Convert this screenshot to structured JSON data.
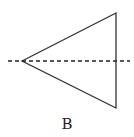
{
  "figure": {
    "label": "B",
    "shape": "triangle",
    "axis": "dashed-horizontal-line",
    "stroke_color": "#333333"
  }
}
